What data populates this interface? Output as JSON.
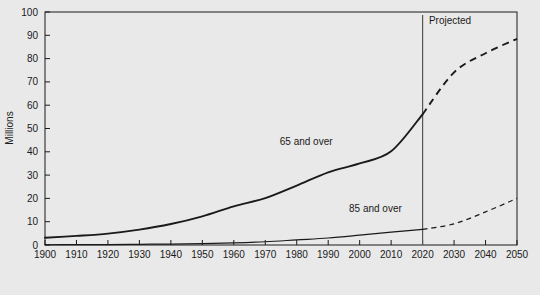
{
  "chart_data": {
    "type": "line",
    "title": "",
    "xlabel": "",
    "ylabel": "Millions",
    "xlim": [
      1900,
      2050
    ],
    "ylim": [
      0,
      100
    ],
    "grid": false,
    "legend_position": "inline-annotation",
    "x_ticks": [
      "1900",
      "1910",
      "1920",
      "1930",
      "1940",
      "1950",
      "1960",
      "1970",
      "1980",
      "1990",
      "2000",
      "2010",
      "2020",
      "2030",
      "2040",
      "2050"
    ],
    "y_ticks": [
      "0",
      "10",
      "20",
      "30",
      "40",
      "50",
      "60",
      "70",
      "80",
      "90",
      "100"
    ],
    "x": [
      1900,
      1910,
      1920,
      1930,
      1940,
      1950,
      1960,
      1970,
      1980,
      1990,
      2000,
      2010,
      2020,
      2030,
      2040,
      2050
    ],
    "series": [
      {
        "name": "65 and over",
        "values": [
          3.1,
          3.9,
          4.9,
          6.6,
          9.0,
          12.3,
          16.6,
          20.1,
          25.5,
          31.2,
          35.0,
          40.2,
          56.1,
          74.1,
          82.3,
          88.5
        ],
        "historical_through": 2020,
        "label": "65 and over",
        "style_historical": "solid",
        "style_projected": "dashed"
      },
      {
        "name": "85 and over",
        "values": [
          0.1,
          0.2,
          0.2,
          0.3,
          0.4,
          0.6,
          0.9,
          1.4,
          2.2,
          3.0,
          4.2,
          5.5,
          6.7,
          9.1,
          14.2,
          20.0
        ],
        "historical_through": 2020,
        "label": "85 and over",
        "style_historical": "solid",
        "style_projected": "dashed"
      }
    ],
    "annotations": [
      {
        "text": "Projected",
        "x": 2022,
        "y": 95
      },
      {
        "text": "65 and over",
        "x": 1983,
        "y": 43
      },
      {
        "text": "85 and over",
        "x": 2005,
        "y": 14
      }
    ],
    "divider": {
      "x": 2020,
      "label": "projection-start"
    },
    "colors": {
      "background": "#e9e9e9",
      "plot_background": "#e9e9e9",
      "line": "#1a1a1a",
      "axis": "#1a1a1a",
      "divider": "#555555"
    }
  }
}
